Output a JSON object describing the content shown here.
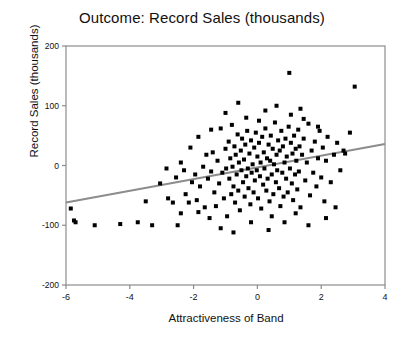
{
  "chart_data": {
    "type": "scatter",
    "title": "Outcome: Record Sales (thousands)",
    "xlabel": "Attractiveness of Band",
    "ylabel": "Record Sales (thousands)",
    "xlim": [
      -6,
      4
    ],
    "ylim": [
      -200,
      200
    ],
    "xticks": [
      -6,
      -4,
      -2,
      0,
      2,
      4
    ],
    "xtick_labels": [
      "-6",
      "-4",
      "-2",
      "0",
      "2",
      "4"
    ],
    "yticks": [
      200,
      100,
      0,
      -100,
      -200
    ],
    "ytick_labels": [
      "200",
      "100",
      "0",
      "-100",
      "-200"
    ],
    "grid": false,
    "legend": null,
    "marker": {
      "shape": "square",
      "color": "#000000",
      "size": 4
    },
    "trendline": {
      "type": "linear",
      "color": "#8c8c8c",
      "width": 2,
      "x_start": -6,
      "y_start": -62,
      "x_end": 4,
      "y_end": 36
    },
    "points": [
      [
        -5.85,
        -72
      ],
      [
        -5.75,
        -92
      ],
      [
        -5.7,
        -95
      ],
      [
        -5.1,
        -100
      ],
      [
        -4.3,
        -98
      ],
      [
        -3.75,
        -95
      ],
      [
        -3.5,
        -60
      ],
      [
        -3.3,
        -100
      ],
      [
        -3.05,
        -30
      ],
      [
        -2.85,
        -5
      ],
      [
        -2.8,
        -55
      ],
      [
        -2.65,
        -62
      ],
      [
        -2.55,
        -20
      ],
      [
        -2.5,
        -100
      ],
      [
        -2.4,
        5
      ],
      [
        -2.3,
        -8
      ],
      [
        -2.25,
        -48
      ],
      [
        -2.15,
        -62
      ],
      [
        -2.1,
        30
      ],
      [
        -2.05,
        -28
      ],
      [
        -1.95,
        -15
      ],
      [
        -1.9,
        -58
      ],
      [
        -1.85,
        48
      ],
      [
        -1.8,
        -35
      ],
      [
        -1.7,
        -2
      ],
      [
        -1.65,
        -70
      ],
      [
        -1.6,
        18
      ],
      [
        -1.55,
        -22
      ],
      [
        -1.5,
        -88
      ],
      [
        -1.45,
        -10
      ],
      [
        -1.4,
        22
      ],
      [
        -1.35,
        -45
      ],
      [
        -1.3,
        -68
      ],
      [
        -1.25,
        8
      ],
      [
        -1.2,
        -30
      ],
      [
        -1.15,
        62
      ],
      [
        -1.1,
        -12
      ],
      [
        -1.05,
        -55
      ],
      [
        -1.0,
        28
      ],
      [
        -0.98,
        -5
      ],
      [
        -0.95,
        -85
      ],
      [
        -0.9,
        40
      ],
      [
        -0.88,
        -22
      ],
      [
        -0.85,
        12
      ],
      [
        -0.82,
        -48
      ],
      [
        -0.8,
        68
      ],
      [
        -0.78,
        -2
      ],
      [
        -0.75,
        -35
      ],
      [
        -0.72,
        32
      ],
      [
        -0.7,
        -62
      ],
      [
        -0.68,
        18
      ],
      [
        -0.65,
        -15
      ],
      [
        -0.62,
        52
      ],
      [
        -0.6,
        -42
      ],
      [
        -0.58,
        5
      ],
      [
        -0.55,
        -75
      ],
      [
        -0.52,
        25
      ],
      [
        -0.5,
        -8
      ],
      [
        -0.48,
        45
      ],
      [
        -0.45,
        -28
      ],
      [
        -0.42,
        10
      ],
      [
        -0.4,
        -52
      ],
      [
        -0.38,
        35
      ],
      [
        -0.35,
        -18
      ],
      [
        -0.32,
        58
      ],
      [
        -0.3,
        -5
      ],
      [
        -0.28,
        -38
      ],
      [
        -0.25,
        20
      ],
      [
        -0.22,
        -65
      ],
      [
        -0.2,
        42
      ],
      [
        -0.18,
        -12
      ],
      [
        -0.15,
        2
      ],
      [
        -0.12,
        -45
      ],
      [
        -0.1,
        30
      ],
      [
        -0.08,
        -25
      ],
      [
        -0.05,
        55
      ],
      [
        -0.02,
        -8
      ],
      [
        0.0,
        15
      ],
      [
        0.02,
        -55
      ],
      [
        0.05,
        38
      ],
      [
        0.08,
        -18
      ],
      [
        0.1,
        5
      ],
      [
        0.12,
        -72
      ],
      [
        0.15,
        48
      ],
      [
        0.18,
        -32
      ],
      [
        0.2,
        22
      ],
      [
        0.22,
        -5
      ],
      [
        0.25,
        62
      ],
      [
        0.28,
        -42
      ],
      [
        0.3,
        12
      ],
      [
        0.32,
        -22
      ],
      [
        0.35,
        35
      ],
      [
        0.38,
        -60
      ],
      [
        0.4,
        8
      ],
      [
        0.42,
        50
      ],
      [
        0.45,
        -15
      ],
      [
        0.48,
        28
      ],
      [
        0.5,
        -48
      ],
      [
        0.52,
        2
      ],
      [
        0.55,
        72
      ],
      [
        0.58,
        -28
      ],
      [
        0.6,
        18
      ],
      [
        0.62,
        -8
      ],
      [
        0.65,
        42
      ],
      [
        0.68,
        -38
      ],
      [
        0.7,
        25
      ],
      [
        0.72,
        -68
      ],
      [
        0.75,
        58
      ],
      [
        0.78,
        -12
      ],
      [
        0.8,
        32
      ],
      [
        0.82,
        -52
      ],
      [
        0.85,
        5
      ],
      [
        0.88,
        45
      ],
      [
        0.9,
        -22
      ],
      [
        0.92,
        15
      ],
      [
        0.95,
        -45
      ],
      [
        0.98,
        65
      ],
      [
        1.0,
        155
      ],
      [
        1.02,
        -5
      ],
      [
        1.05,
        38
      ],
      [
        1.08,
        -30
      ],
      [
        1.1,
        20
      ],
      [
        1.12,
        -58
      ],
      [
        1.15,
        50
      ],
      [
        1.18,
        -15
      ],
      [
        1.2,
        28
      ],
      [
        1.22,
        8
      ],
      [
        1.25,
        -40
      ],
      [
        1.28,
        60
      ],
      [
        1.3,
        -10
      ],
      [
        1.32,
        32
      ],
      [
        1.35,
        -70
      ],
      [
        1.4,
        18
      ],
      [
        1.45,
        45
      ],
      [
        1.5,
        -25
      ],
      [
        1.55,
        5
      ],
      [
        1.6,
        70
      ],
      [
        1.65,
        -50
      ],
      [
        1.7,
        25
      ],
      [
        1.75,
        -12
      ],
      [
        1.8,
        40
      ],
      [
        1.85,
        -35
      ],
      [
        1.9,
        12
      ],
      [
        1.95,
        58
      ],
      [
        2.0,
        -20
      ],
      [
        2.05,
        30
      ],
      [
        2.1,
        -60
      ],
      [
        2.15,
        8
      ],
      [
        2.2,
        48
      ],
      [
        2.3,
        -28
      ],
      [
        2.4,
        18
      ],
      [
        2.5,
        38
      ],
      [
        2.6,
        -8
      ],
      [
        2.7,
        25
      ],
      [
        2.9,
        55
      ],
      [
        3.05,
        132
      ],
      [
        -1.0,
        88
      ],
      [
        0.25,
        92
      ],
      [
        0.6,
        100
      ],
      [
        1.05,
        85
      ],
      [
        1.45,
        78
      ],
      [
        -0.35,
        80
      ],
      [
        -2.4,
        -80
      ],
      [
        -1.15,
        -105
      ],
      [
        0.35,
        -108
      ],
      [
        1.6,
        -100
      ],
      [
        2.15,
        -88
      ],
      [
        -0.75,
        -112
      ],
      [
        0.85,
        -95
      ],
      [
        -1.85,
        -78
      ],
      [
        2.45,
        -70
      ],
      [
        1.35,
        95
      ],
      [
        -0.6,
        105
      ],
      [
        0.05,
        75
      ],
      [
        1.9,
        65
      ],
      [
        -1.45,
        60
      ],
      [
        2.75,
        20
      ],
      [
        0.45,
        -85
      ],
      [
        -0.2,
        -95
      ],
      [
        1.2,
        -80
      ]
    ]
  }
}
